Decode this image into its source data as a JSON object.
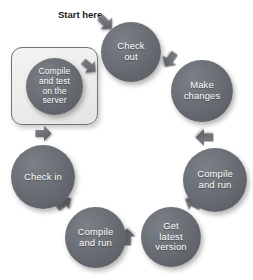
{
  "diagram": {
    "title": "Start here",
    "start_label": "Start here",
    "colors": {
      "node_fill": "#6a6e75",
      "node_text": "#ffffff",
      "arrow_fill": "#6f7277",
      "highlight_border": "#6f7378",
      "highlight_fill": "#ececeb",
      "background": "#ffffff",
      "label_text": "#1b1b1b"
    },
    "nodes": [
      {
        "id": "check-out",
        "label": "Check\nout",
        "x": 101,
        "y": 22,
        "size": 60,
        "font_size": 9.5,
        "highlighted": false
      },
      {
        "id": "make-changes",
        "label": "Make\nchanges",
        "x": 171,
        "y": 60,
        "size": 62,
        "font_size": 9.5,
        "highlighted": false
      },
      {
        "id": "compile-and-run-right",
        "label": "Compile\nand run",
        "x": 183,
        "y": 148,
        "size": 64,
        "font_size": 9.5,
        "highlighted": false
      },
      {
        "id": "get-latest-version",
        "label": "Get\nlatest\nversion",
        "x": 141,
        "y": 207,
        "size": 60,
        "font_size": 9.5,
        "highlighted": false
      },
      {
        "id": "compile-and-run-left",
        "label": "Compile\nand run",
        "x": 65,
        "y": 207,
        "size": 61,
        "font_size": 9.5,
        "highlighted": false
      },
      {
        "id": "check-in",
        "label": "Check in",
        "x": 11,
        "y": 145,
        "size": 64,
        "font_size": 9.5,
        "highlighted": false
      },
      {
        "id": "compile-and-test-on-the-server",
        "label": "Compile\nand test\non the\nserver",
        "x": 26,
        "y": 58,
        "size": 57,
        "font_size": 8.5,
        "highlighted": true
      }
    ],
    "highlight_box": {
      "id": "highlight-box",
      "x": 11,
      "y": 47,
      "width": 87,
      "height": 78
    },
    "arrows": [
      {
        "id": "arrow-start-to-check-out",
        "x": 96,
        "y": 13,
        "size": 20,
        "rotation": 45
      },
      {
        "id": "arrow-check-out-to-make-changes",
        "x": 160,
        "y": 50,
        "size": 20,
        "rotation": 125
      },
      {
        "id": "arrow-make-changes-to-compile-run",
        "x": 194,
        "y": 127,
        "size": 21,
        "rotation": 180
      },
      {
        "id": "arrow-compile-run-to-get-latest",
        "x": 183,
        "y": 193,
        "size": 20,
        "rotation": 205
      },
      {
        "id": "arrow-get-latest-to-compile-run",
        "x": 117,
        "y": 227,
        "size": 20,
        "rotation": 270
      },
      {
        "id": "arrow-compile-run-to-check-in",
        "x": 54,
        "y": 193,
        "size": 20,
        "rotation": 325
      },
      {
        "id": "arrow-check-in-to-compile-test",
        "x": 34,
        "y": 124,
        "size": 19,
        "rotation": 0
      },
      {
        "id": "arrow-compile-test-to-check-out",
        "x": 80,
        "y": 57,
        "size": 19,
        "rotation": 40
      }
    ]
  }
}
